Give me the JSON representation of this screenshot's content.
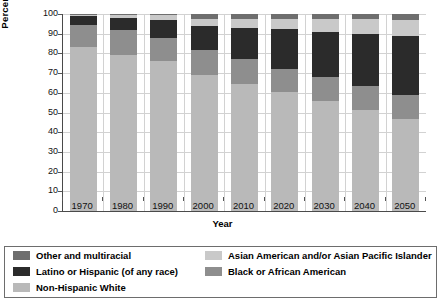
{
  "chart_data": {
    "type": "bar",
    "stacked": true,
    "title": "",
    "xlabel": "Year",
    "ylabel": "Percentage",
    "ylim": [
      0,
      100
    ],
    "ytick_values": [
      0,
      10,
      20,
      30,
      40,
      50,
      60,
      70,
      80,
      90,
      100
    ],
    "ytick_labels": [
      "0",
      "10",
      "20",
      "30",
      "40",
      "50",
      "60",
      "70",
      "80",
      "90",
      "100"
    ],
    "grid": true,
    "legend_position": "below",
    "categories": [
      "1970",
      "1980",
      "1990",
      "2000",
      "2010",
      "2020",
      "2030",
      "2040",
      "2050"
    ],
    "series": [
      {
        "name": "Non-Hispanic White",
        "color": "#b9b9b9",
        "values": [
          83.2,
          79.4,
          76.2,
          69.2,
          64.4,
          60.3,
          55.8,
          51.2,
          46.6
        ]
      },
      {
        "name": "Black or African American",
        "color": "#8e8e8e",
        "values": [
          11.2,
          12.4,
          11.6,
          12.3,
          12.9,
          12.0,
          12.1,
          12.1,
          12.3
        ]
      },
      {
        "name": "Latino or Hispanic (of any race)",
        "color": "#2b2b2b",
        "values": [
          4.5,
          6.3,
          9.0,
          12.3,
          15.6,
          19.9,
          23.2,
          26.8,
          29.8
        ]
      },
      {
        "name": "Asian American and/or Asian Pacific Islander",
        "color": "#c9c9c9",
        "values": [
          0.6,
          1.3,
          2.8,
          3.8,
          4.6,
          5.5,
          6.4,
          7.4,
          8.3
        ]
      },
      {
        "name": "Other and multiracial",
        "color": "#6e6e6e",
        "values": [
          0.5,
          0.6,
          0.4,
          2.4,
          2.5,
          2.3,
          2.5,
          2.5,
          3.0
        ]
      }
    ],
    "legend_left_column": [
      "Other and multiracial",
      "Latino or Hispanic (of any race)",
      "Non-Hispanic White"
    ],
    "legend_right_column": [
      "Asian American and/or Asian Pacific Islander",
      "Black or African American"
    ]
  },
  "legend": {
    "items": [
      {
        "label": "Other and multiracial",
        "color": "#6e6e6e"
      },
      {
        "label": "Asian American and/or Asian Pacific Islander",
        "color": "#c9c9c9"
      },
      {
        "label": "Latino or Hispanic (of any race)",
        "color": "#2b2b2b"
      },
      {
        "label": "Black or African American",
        "color": "#8e8e8e"
      },
      {
        "label": "Non-Hispanic White",
        "color": "#b9b9b9"
      }
    ]
  }
}
